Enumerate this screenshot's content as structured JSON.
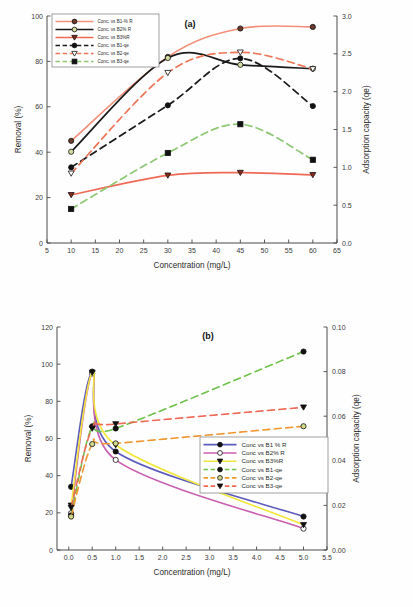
{
  "figure": {
    "panel_a_tag": "(a)",
    "panel_b_tag": "(b)"
  },
  "chart_data": [
    {
      "type": "line",
      "panel": "(a)",
      "title": "",
      "xlabel": "Concentration (mg/L)",
      "ylabel": "Removal (%)",
      "y2label": "Adsorption capacity (qe)",
      "xlim": [
        5,
        65
      ],
      "ylim": [
        0,
        100
      ],
      "y2lim": [
        0.0,
        3.0
      ],
      "xticks": [
        5,
        10,
        15,
        20,
        25,
        30,
        35,
        40,
        45,
        50,
        55,
        60,
        65
      ],
      "xticklabels": [
        "5",
        "10",
        "15",
        "20",
        "25",
        "30",
        "35",
        "40",
        "45",
        "50",
        "55",
        "60",
        "65"
      ],
      "yticks": [
        0,
        20,
        40,
        60,
        80,
        100
      ],
      "yticklabels": [
        "0",
        "20",
        "40",
        "60",
        "80",
        "100"
      ],
      "y2ticks": [
        0.0,
        0.5,
        1.0,
        1.5,
        2.0,
        2.5,
        3.0
      ],
      "y2ticklabels": [
        "0.0",
        "0.5",
        "1.0",
        "1.5",
        "2.0",
        "2.5",
        "3.0"
      ],
      "grid": false,
      "legend_position": "top-left",
      "x": [
        10,
        30,
        45,
        60
      ],
      "series": [
        {
          "name": "Conc. vs B1-% R",
          "axis": "left",
          "style": "solid",
          "color": "#f4907a",
          "marker": "circle-filled",
          "marker_fill": "#6b3a2a",
          "values": [
            45.0,
            82.0,
            94.5,
            95.2
          ]
        },
        {
          "name": "Conc. vs B2% R",
          "axis": "left",
          "style": "solid",
          "color": "#1a1a1a",
          "marker": "circle-open",
          "marker_fill": "#d8dca0",
          "values": [
            40.2,
            81.5,
            78.5,
            76.8
          ]
        },
        {
          "name": "Conc. vs B3%R",
          "axis": "left",
          "style": "solid",
          "color": "#ef6a56",
          "marker": "triangle-down",
          "marker_fill": "#8a2a1a",
          "values": [
            21.2,
            29.8,
            31.0,
            30.0
          ]
        },
        {
          "name": "Conc. vs B1-qe",
          "axis": "right",
          "style": "dashed",
          "color": "#1a1a1a",
          "marker": "circle-filled",
          "marker_fill": "#111111",
          "values": [
            1.0,
            1.82,
            2.44,
            1.81
          ]
        },
        {
          "name": "Conc. vs B2-qe",
          "axis": "right",
          "style": "dashed",
          "color": "#ee7555",
          "marker": "triangle-open",
          "marker_fill": "#ffffff",
          "values": [
            0.92,
            2.25,
            2.52,
            2.3
          ]
        },
        {
          "name": "Conc. vs B3-qe",
          "axis": "right",
          "style": "dashed",
          "color": "#8dc973",
          "marker": "square-filled",
          "marker_fill": "#111111",
          "values": [
            0.45,
            1.19,
            1.57,
            1.1
          ]
        }
      ]
    },
    {
      "type": "line",
      "panel": "(b)",
      "title": "",
      "xlabel": "Concentration (mg/L)",
      "ylabel": "Removal (%)",
      "y2label": "Adsorption capacity (qe)",
      "xlim": [
        -0.25,
        5.5
      ],
      "ylim": [
        0,
        120
      ],
      "y2lim": [
        0.0,
        0.1
      ],
      "xticks": [
        0.0,
        0.5,
        1.0,
        1.5,
        2.0,
        2.5,
        3.0,
        3.5,
        4.0,
        4.5,
        5.0,
        5.5
      ],
      "xticklabels": [
        "0.0",
        "0.5",
        "1.0",
        "1.5",
        "2.0",
        "2.5",
        "3.0",
        "3.5",
        "4.0",
        "4.5",
        "5.0",
        "5.5"
      ],
      "yticks": [
        0,
        20,
        40,
        60,
        80,
        100,
        120
      ],
      "yticklabels": [
        "0",
        "20",
        "40",
        "60",
        "80",
        "100",
        "120"
      ],
      "y2ticks": [
        0.0,
        0.02,
        0.04,
        0.06,
        0.08,
        0.1
      ],
      "y2ticklabels": [
        "0.00",
        "0.02",
        "0.04",
        "0.06",
        "0.08",
        "0.10"
      ],
      "grid": false,
      "legend_position": "center-right",
      "x": [
        0.05,
        0.5,
        1.0,
        5.0
      ],
      "series": [
        {
          "name": "Conc vs B1 % R",
          "axis": "left",
          "style": "solid",
          "color": "#5b5bbf",
          "marker": "circle-filled",
          "marker_fill": "#111111",
          "values": [
            34.0,
            96.0,
            53.0,
            18.0
          ]
        },
        {
          "name": "Conc vs B2% R",
          "axis": "left",
          "style": "solid",
          "color": "#c85fb0",
          "marker": "circle-open",
          "marker_fill": "#ffffff",
          "values": [
            19.8,
            95.0,
            48.5,
            11.5
          ]
        },
        {
          "name": "Conc vs B3%R",
          "axis": "left",
          "style": "solid",
          "color": "#f2e63c",
          "marker": "triangle-down",
          "marker_fill": "#111111",
          "values": [
            24.0,
            95.5,
            56.5,
            13.5
          ]
        },
        {
          "name": "Conc vs B1-qe",
          "axis": "right",
          "style": "dashed",
          "color": "#6ec24a",
          "marker": "circle-filled",
          "marker_fill": "#111111",
          "values": [
            0.0155,
            0.0555,
            0.0545,
            0.089
          ]
        },
        {
          "name": "Conc vs B2-qe",
          "axis": "right",
          "style": "dashed",
          "color": "#f0962e",
          "marker": "circle-open",
          "marker_fill": "#cfd88a",
          "values": [
            0.015,
            0.0475,
            0.0478,
            0.0555
          ]
        },
        {
          "name": "Conc vs B3-qe",
          "axis": "right",
          "style": "dashed",
          "color": "#ef6a56",
          "marker": "triangle-down",
          "marker_fill": "#111111",
          "values": [
            0.019,
            0.0545,
            0.0565,
            0.064
          ]
        }
      ]
    }
  ]
}
